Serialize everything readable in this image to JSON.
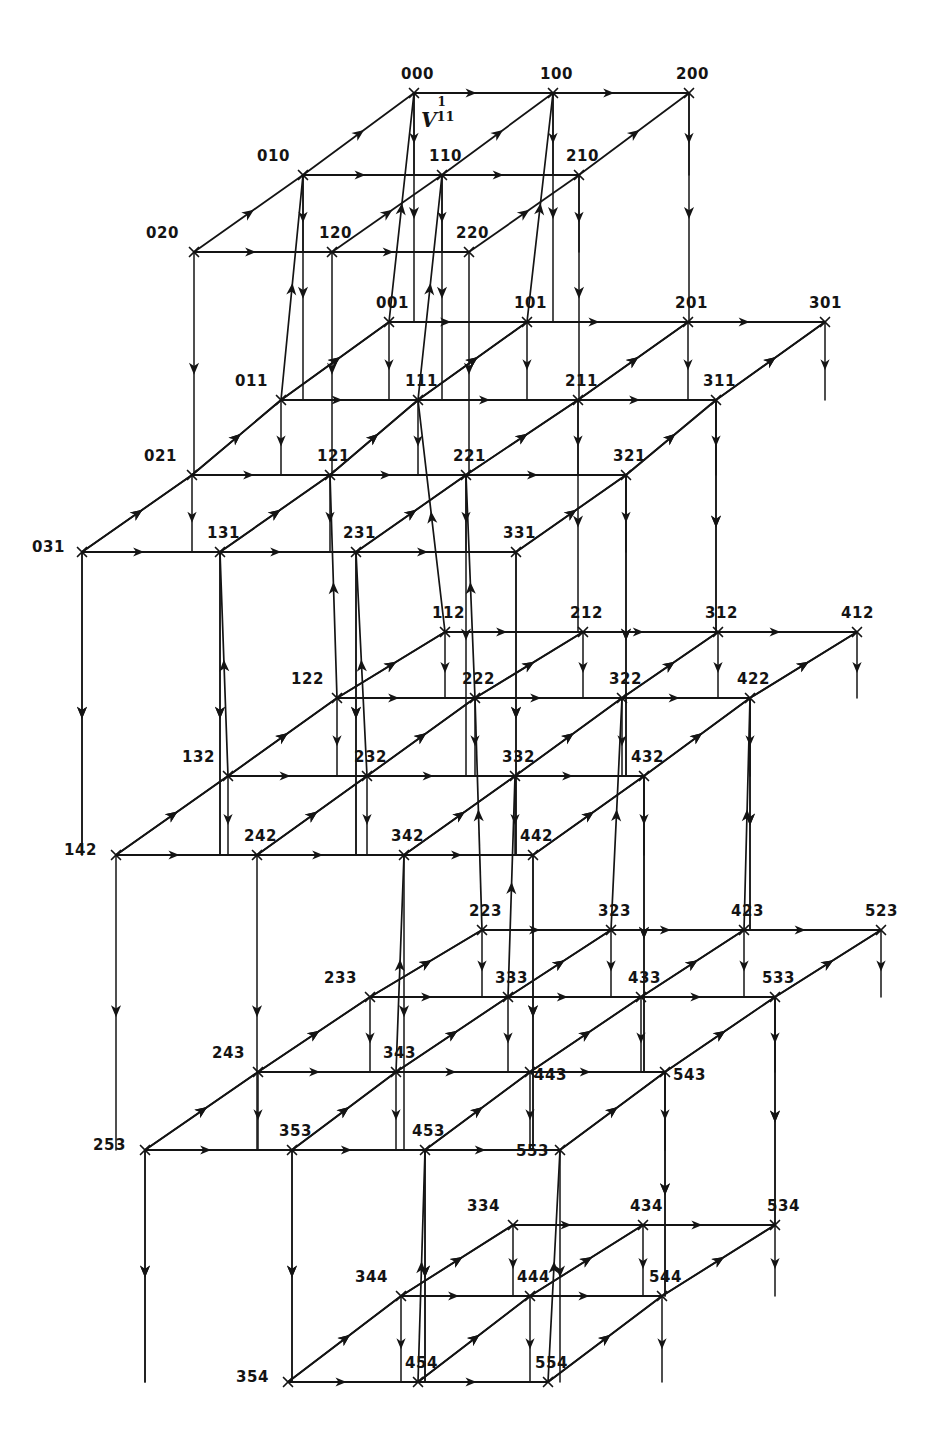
{
  "figure": {
    "kind": "3d-lattice-graph",
    "title_text": "",
    "annotation": {
      "base": "V",
      "superscript": "1",
      "subscript": "11",
      "full": "V11^1"
    },
    "ink_color": "#141414",
    "background_color": "#ffffff",
    "layer_count": 5,
    "layers": [
      {
        "index": 0,
        "k": 0,
        "rows": [
          "0",
          "1",
          "2"
        ],
        "cols": [
          "0",
          "1",
          "2"
        ]
      },
      {
        "index": 1,
        "k": 1,
        "rows": [
          "0",
          "1",
          "2",
          "3"
        ],
        "cols": [
          "0",
          "1",
          "2",
          "3"
        ]
      },
      {
        "index": 2,
        "k": 2,
        "rows": [
          "1",
          "2",
          "3",
          "4"
        ],
        "cols": [
          "1",
          "2",
          "3",
          "4"
        ]
      },
      {
        "index": 3,
        "k": 3,
        "rows": [
          "2",
          "3",
          "4",
          "5"
        ],
        "cols": [
          "2",
          "3",
          "4",
          "5"
        ]
      },
      {
        "index": 4,
        "k": 4,
        "rows": [
          "3",
          "4",
          "5"
        ],
        "cols": [
          "3",
          "4",
          "5"
        ]
      }
    ],
    "nodes": [
      {
        "label": "000",
        "x": 414,
        "y": 93
      },
      {
        "label": "100",
        "x": 553,
        "y": 93
      },
      {
        "label": "200",
        "x": 689,
        "y": 93
      },
      {
        "label": "010",
        "x": 303,
        "y": 175
      },
      {
        "label": "110",
        "x": 442,
        "y": 175
      },
      {
        "label": "210",
        "x": 579,
        "y": 175
      },
      {
        "label": "020",
        "x": 194,
        "y": 252
      },
      {
        "label": "120",
        "x": 332,
        "y": 252
      },
      {
        "label": "220",
        "x": 469,
        "y": 252
      },
      {
        "label": "001",
        "x": 389,
        "y": 322
      },
      {
        "label": "101",
        "x": 527,
        "y": 322
      },
      {
        "label": "201",
        "x": 688,
        "y": 322
      },
      {
        "label": "301",
        "x": 825,
        "y": 322
      },
      {
        "label": "011",
        "x": 281,
        "y": 400
      },
      {
        "label": "111",
        "x": 418,
        "y": 400
      },
      {
        "label": "211",
        "x": 578,
        "y": 400
      },
      {
        "label": "311",
        "x": 716,
        "y": 400
      },
      {
        "label": "021",
        "x": 192,
        "y": 475
      },
      {
        "label": "121",
        "x": 330,
        "y": 475
      },
      {
        "label": "221",
        "x": 466,
        "y": 475
      },
      {
        "label": "321",
        "x": 626,
        "y": 475
      },
      {
        "label": "031",
        "x": 82,
        "y": 552
      },
      {
        "label": "131",
        "x": 220,
        "y": 552
      },
      {
        "label": "231",
        "x": 356,
        "y": 552
      },
      {
        "label": "331",
        "x": 516,
        "y": 552
      },
      {
        "label": "112",
        "x": 445,
        "y": 632
      },
      {
        "label": "212",
        "x": 583,
        "y": 632
      },
      {
        "label": "312",
        "x": 718,
        "y": 632
      },
      {
        "label": "412",
        "x": 857,
        "y": 632
      },
      {
        "label": "122",
        "x": 337,
        "y": 698
      },
      {
        "label": "222",
        "x": 475,
        "y": 698
      },
      {
        "label": "322",
        "x": 622,
        "y": 698
      },
      {
        "label": "422",
        "x": 750,
        "y": 698
      },
      {
        "label": "132",
        "x": 228,
        "y": 776
      },
      {
        "label": "232",
        "x": 367,
        "y": 776
      },
      {
        "label": "332",
        "x": 515,
        "y": 776
      },
      {
        "label": "432",
        "x": 644,
        "y": 776
      },
      {
        "label": "142",
        "x": 116,
        "y": 855
      },
      {
        "label": "242",
        "x": 257,
        "y": 855
      },
      {
        "label": "342",
        "x": 404,
        "y": 855
      },
      {
        "label": "442",
        "x": 533,
        "y": 855
      },
      {
        "label": "223",
        "x": 482,
        "y": 930
      },
      {
        "label": "323",
        "x": 611,
        "y": 930
      },
      {
        "label": "423",
        "x": 744,
        "y": 930
      },
      {
        "label": "523",
        "x": 881,
        "y": 930
      },
      {
        "label": "233",
        "x": 370,
        "y": 997
      },
      {
        "label": "333",
        "x": 508,
        "y": 997
      },
      {
        "label": "433",
        "x": 641,
        "y": 997
      },
      {
        "label": "533",
        "x": 775,
        "y": 997
      },
      {
        "label": "243",
        "x": 258,
        "y": 1072
      },
      {
        "label": "343",
        "x": 396,
        "y": 1072
      },
      {
        "label": "443",
        "x": 530,
        "y": 1072
      },
      {
        "label": "543",
        "x": 665,
        "y": 1072
      },
      {
        "label": "253",
        "x": 145,
        "y": 1150
      },
      {
        "label": "353",
        "x": 292,
        "y": 1150
      },
      {
        "label": "453",
        "x": 425,
        "y": 1150
      },
      {
        "label": "553",
        "x": 560,
        "y": 1150
      },
      {
        "label": "334",
        "x": 513,
        "y": 1225
      },
      {
        "label": "434",
        "x": 643,
        "y": 1225
      },
      {
        "label": "534",
        "x": 775,
        "y": 1225
      },
      {
        "label": "344",
        "x": 401,
        "y": 1296
      },
      {
        "label": "444",
        "x": 530,
        "y": 1296
      },
      {
        "label": "544",
        "x": 662,
        "y": 1296
      },
      {
        "label": "354",
        "x": 288,
        "y": 1382
      },
      {
        "label": "454",
        "x": 418,
        "y": 1382
      },
      {
        "label": "554",
        "x": 548,
        "y": 1382
      }
    ],
    "edge_kinds": [
      {
        "id": "horizontal",
        "direction": "left-to-right",
        "arrow": "mid-arrowhead"
      },
      {
        "id": "vertical-in-layer",
        "direction": "top-to-bottom",
        "arrow": "mid-arrowhead"
      },
      {
        "id": "diagonal-depth",
        "direction": "lower-left-to-upper-right",
        "arrow": "mid-arrowhead"
      },
      {
        "id": "inter-layer-drop",
        "direction": "top-to-bottom",
        "arrow": "mid-arrowhead"
      }
    ]
  }
}
